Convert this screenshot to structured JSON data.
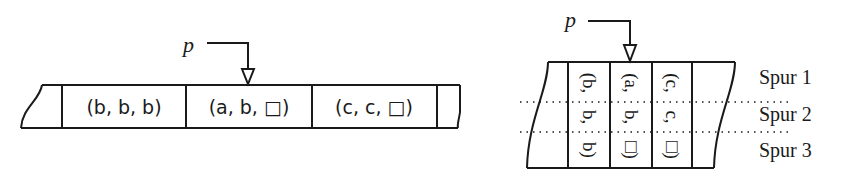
{
  "left_diagram": {
    "pointer_label": "p",
    "cells": [
      {
        "label": "(b, b, b)"
      },
      {
        "label": "(a, b, □)"
      },
      {
        "label": "(c, c, □)"
      }
    ],
    "pointed_cell_index": 1
  },
  "right_diagram": {
    "pointer_label": "p",
    "tracks": [
      "Spur 1",
      "Spur 2",
      "Spur 3"
    ],
    "columns": [
      {
        "parts": [
          "(b,",
          "b,",
          "b)"
        ]
      },
      {
        "parts": [
          "(a,",
          "b,",
          "□)"
        ]
      },
      {
        "parts": [
          "(c,",
          "c,",
          "□)"
        ]
      }
    ],
    "pointed_column_index": 1
  },
  "colors": {
    "line": "#1a1a1a",
    "background": "#ffffff"
  }
}
